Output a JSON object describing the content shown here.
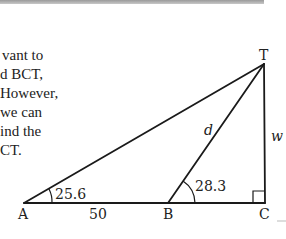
{
  "text": {
    "lines": [
      "vant to",
      "d BCT,",
      "However,",
      " we can",
      "ind the",
      "CT."
    ]
  },
  "diagram": {
    "vertices": {
      "A": {
        "label": "A",
        "x": 24,
        "y": 203
      },
      "B": {
        "label": "B",
        "x": 168,
        "y": 203
      },
      "C": {
        "label": "C",
        "x": 265,
        "y": 203
      },
      "T": {
        "label": "T",
        "x": 264,
        "y": 64
      }
    },
    "sides": {
      "AB": "50",
      "BT": "d",
      "CT": "w"
    },
    "angles": {
      "A": "25.6",
      "B": "28.3"
    },
    "right_angle_at": "C",
    "line_color": "#1a1a1a"
  }
}
